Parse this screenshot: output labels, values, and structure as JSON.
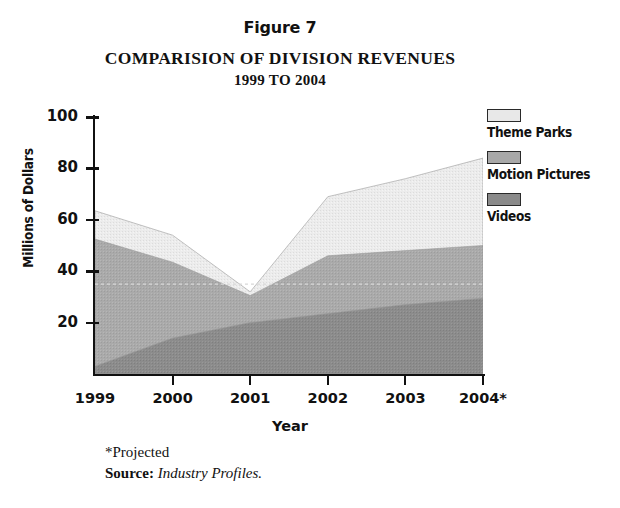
{
  "figure": {
    "label": "Figure 7",
    "title": "COMPARISION OF DIVISION REVENUES",
    "subtitle": "1999 TO 2004"
  },
  "axes": {
    "y_title": "Millions of Dollars",
    "x_title": "Year",
    "y_ticks": [
      "100",
      "80",
      "60",
      "40",
      "20"
    ],
    "x_ticks": [
      "1999",
      "2000",
      "2001",
      "2002",
      "2003",
      "2004*"
    ]
  },
  "legend": {
    "entries": [
      {
        "label": "Theme Parks",
        "color": "#e8e8e8"
      },
      {
        "label": "Motion Pictures",
        "color": "#a8a8a8"
      },
      {
        "label": "Videos",
        "color": "#8a8a8a"
      }
    ]
  },
  "footnotes": {
    "projected": "*Projected",
    "source_label": "Source:",
    "source_value": "Industry Profiles."
  },
  "chart_data": {
    "type": "area",
    "stacked": true,
    "xlabel": "Year",
    "ylabel": "Millions of Dollars",
    "categories": [
      "1999",
      "2000",
      "2001",
      "2002",
      "2003",
      "2004*"
    ],
    "ylim": [
      0,
      100
    ],
    "yticks": [
      20,
      40,
      60,
      80,
      100
    ],
    "grid": "dotted horizontal line at 35",
    "legend_position": "right",
    "annotations": [
      "*Projected",
      "Source: Industry Profiles."
    ],
    "series": [
      {
        "name": "Videos",
        "color": "#8a8a8a",
        "values": [
          3,
          14,
          20,
          23.5,
          27,
          29.5
        ]
      },
      {
        "name": "Motion Pictures",
        "color": "#a8a8a8",
        "values": [
          49.5,
          29.5,
          10.5,
          22.5,
          21,
          20.5
        ]
      },
      {
        "name": "Theme Parks",
        "color": "#e8e8e8",
        "values": [
          11,
          10.5,
          1.5,
          23,
          28,
          34
        ]
      }
    ],
    "cumulative_tops": {
      "Videos": [
        3,
        14,
        20,
        23.5,
        27,
        29.5
      ],
      "Motion Pictures": [
        52.5,
        43.5,
        30.5,
        46,
        48,
        50
      ],
      "Theme Parks": [
        63.5,
        54,
        32,
        69,
        76,
        84
      ]
    },
    "totals": [
      63.5,
      54,
      32,
      69,
      76,
      84
    ]
  }
}
